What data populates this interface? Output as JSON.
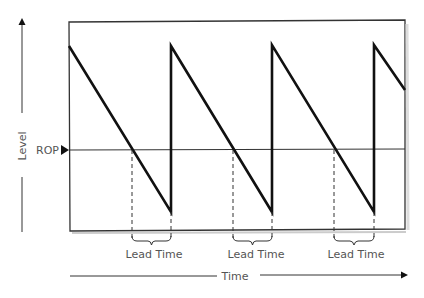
{
  "diagram": {
    "type": "inventory-sawtooth",
    "labels": {
      "y_axis": "Level",
      "x_axis": "Time",
      "reorder_point": "ROP",
      "lead_time": "Lead Time"
    },
    "lead_time_labels": [
      "Lead Time",
      "Lead Time",
      "Lead Time"
    ],
    "cycles": 3,
    "colors": {
      "line": "#111111",
      "frame": "#333333",
      "text": "#555555",
      "background": "#ffffff"
    }
  }
}
